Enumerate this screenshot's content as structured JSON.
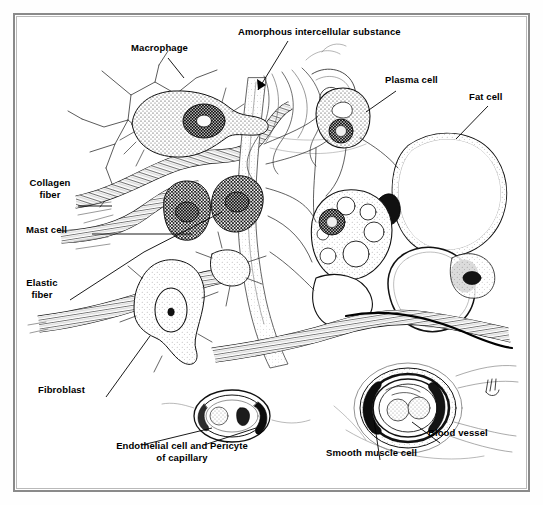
{
  "figure": {
    "type": "biology-histology-diagram",
    "background_color": "#ffffff",
    "ink_color": "#000000",
    "frame_color": "#8a8a8a"
  },
  "labels": [
    {
      "id": "macrophage",
      "text": "Macrophage",
      "x": 131,
      "y": 47,
      "align": "left",
      "pointer": "line"
    },
    {
      "id": "amorphous",
      "text": "Amorphous intercellular substance",
      "x": 238,
      "y": 31,
      "align": "left",
      "pointer": "arrow"
    },
    {
      "id": "plasma-cell",
      "text": "Plasma cell",
      "x": 385,
      "y": 79,
      "align": "left",
      "pointer": "line"
    },
    {
      "id": "fat-cell",
      "text": "Fat cell",
      "x": 469,
      "y": 96,
      "align": "left",
      "pointer": "line"
    },
    {
      "id": "collagen-fiber",
      "text": "Collagen\nfiber",
      "x": 40,
      "y": 182,
      "align": "center",
      "pointer": "line"
    },
    {
      "id": "mast-cell",
      "text": "Mast cell",
      "x": 30,
      "y": 229,
      "align": "left",
      "pointer": "line"
    },
    {
      "id": "elastic-fiber",
      "text": "Elastic\nfiber",
      "x": 33,
      "y": 282,
      "align": "center",
      "pointer": "line"
    },
    {
      "id": "fibroblast",
      "text": "Fibroblast",
      "x": 40,
      "y": 389,
      "align": "left",
      "pointer": "line"
    },
    {
      "id": "endothelial",
      "text": "Endothelial cell and Pericyte\nof capillary",
      "x": 105,
      "y": 445,
      "align": "center",
      "pointer": "double-line"
    },
    {
      "id": "smooth-muscle",
      "text": "Smooth muscle cell",
      "x": 326,
      "y": 452,
      "align": "left",
      "pointer": "line"
    },
    {
      "id": "blood-vessel",
      "text": "Blood vessel",
      "x": 428,
      "y": 432,
      "align": "left",
      "pointer": "line"
    }
  ],
  "structures": [
    {
      "id": "macrophage-cell",
      "name": "Macrophage",
      "description": "stippled amoeboid cell with large oval nucleus and fine radiating cytoplasmic processes"
    },
    {
      "id": "mast-cells",
      "name": "Mast cells",
      "description": "two densely granulated oval cells with dark central nuclei"
    },
    {
      "id": "plasma-cell-body",
      "name": "Plasma cell",
      "description": "oval cell with pale Golgi zone and eccentric clock-face nucleus"
    },
    {
      "id": "fat-cells",
      "name": "Fat cells",
      "description": "large empty signet-ring cells with thin rim of cytoplasm and flattened peripheral nuclei"
    },
    {
      "id": "fibroblast-cell",
      "name": "Fibroblast",
      "description": "spindle/stellate cell with pale vacuolated cytoplasm and oval nucleus"
    },
    {
      "id": "collagen-bundles",
      "name": "Collagen fibers",
      "description": "thick wavy striated ribbon bundles"
    },
    {
      "id": "elastic-fibers",
      "name": "Elastic fibers",
      "description": "thin branching dark threads forming a network"
    },
    {
      "id": "ground-substance",
      "name": "Amorphous intercellular substance",
      "description": "pale stippled matrix between fibers and cells"
    },
    {
      "id": "capillary",
      "name": "Capillary",
      "description": "small cross-sectioned vessel lined by endothelial cell with a pericyte and a red blood cell in the lumen"
    },
    {
      "id": "blood-vessel-body",
      "name": "Blood vessel",
      "description": "larger vessel in cross section with concentric smooth-muscle layers and two erythrocytes in the lumen"
    },
    {
      "id": "artist-signature",
      "name": "Artist signature",
      "description": "small handwritten mark at lower right of the drawing"
    }
  ]
}
